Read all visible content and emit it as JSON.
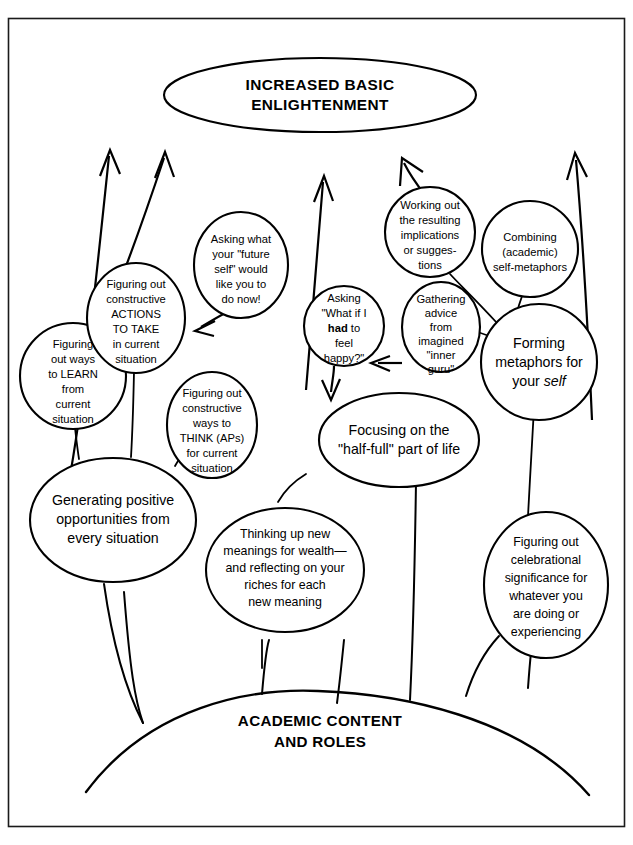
{
  "figure": {
    "title_banner": {
      "lines": [
        "INCREASED BASIC",
        "ENLIGHTENMENT"
      ]
    },
    "ground_banner": {
      "lines": [
        "ACADEMIC CONTENT",
        "AND ROLES"
      ]
    },
    "colors": {
      "stroke": "#000000",
      "fill": "#ffffff",
      "frame": "#1a1a1a"
    },
    "nodes": [
      {
        "id": "learn-from-current",
        "shape": "circle",
        "lines": [
          "Figuring",
          "out ways",
          "to LEARN",
          "from",
          "current",
          "situation"
        ]
      },
      {
        "id": "constructive-actions",
        "shape": "ellipse",
        "lines": [
          "Figuring out",
          "constructive",
          "ACTIONS",
          "TO TAKE",
          "in current",
          "situation"
        ]
      },
      {
        "id": "future-self",
        "shape": "ellipse",
        "lines": [
          "Asking what",
          "your \"future",
          "self\" would",
          "like you to",
          "do now!"
        ]
      },
      {
        "id": "constructive-think",
        "shape": "ellipse",
        "lines": [
          "Figuring out",
          "constructive",
          "ways to",
          "THINK (APs)",
          "for current",
          "situation"
        ]
      },
      {
        "id": "generating-opportunities",
        "shape": "ellipse",
        "lines": [
          "Generating positive",
          "opportunities from",
          "every situation"
        ]
      },
      {
        "id": "thinking-new-meanings",
        "shape": "ellipse",
        "lines": [
          "Thinking up new",
          "meanings for wealth—",
          "and reflecting on your",
          "riches for each",
          "new meaning"
        ]
      },
      {
        "id": "had-to-feel-happy",
        "shape": "circle",
        "lines": [
          "Asking",
          "\"What if I",
          "had to",
          "feel",
          "happy?\""
        ],
        "emphasis": {
          "word": "had",
          "style": "bold",
          "line_index": 2
        }
      },
      {
        "id": "half-full",
        "shape": "ellipse",
        "lines": [
          "Focusing on the",
          "\"half-full\" part of life"
        ]
      },
      {
        "id": "working-out-implications",
        "shape": "circle",
        "lines": [
          "Working out",
          "the resulting",
          "implications",
          "or sugges-",
          "tions"
        ]
      },
      {
        "id": "inner-guru",
        "shape": "ellipse",
        "lines": [
          "Gathering",
          "advice",
          "from",
          "imagined",
          "\"inner",
          "guru\""
        ]
      },
      {
        "id": "combining-self-metaphors",
        "shape": "circle",
        "lines": [
          "Combining",
          "(academic)",
          "self-metaphors"
        ]
      },
      {
        "id": "forming-metaphors",
        "shape": "circle",
        "lines": [
          "Forming",
          "metaphors for",
          "your self"
        ],
        "emphasis": {
          "word": "self",
          "style": "italic",
          "line_index": 2
        }
      },
      {
        "id": "celebrational-significance",
        "shape": "ellipse",
        "lines": [
          "Figuring out",
          "celebrational",
          "significance for",
          "whatever you",
          "are doing or",
          "experiencing"
        ]
      }
    ]
  }
}
